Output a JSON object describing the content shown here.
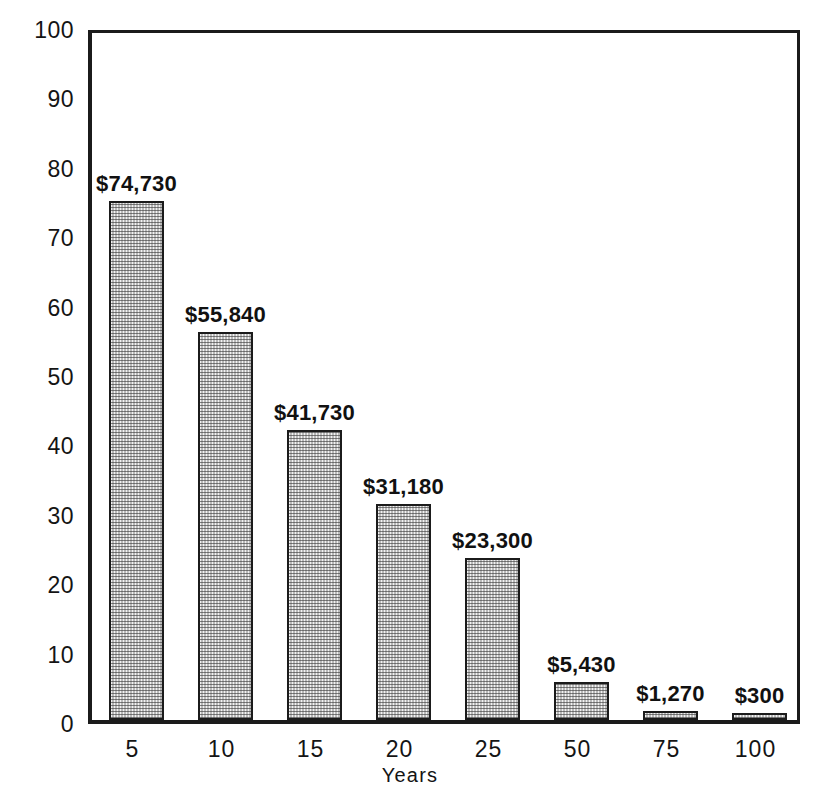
{
  "chart_data": {
    "type": "bar",
    "title": "",
    "xlabel": "Years",
    "ylabel": "Thousands of Dollars",
    "categories": [
      "5",
      "10",
      "15",
      "20",
      "25",
      "50",
      "75",
      "100"
    ],
    "values": [
      74.73,
      55.84,
      41.73,
      31.18,
      23.3,
      5.43,
      1.27,
      0.3
    ],
    "value_labels": [
      "$74,730",
      "$55,840",
      "$41,730",
      "$31,180",
      "$23,300",
      "$5,430",
      "$1,270",
      "$300"
    ],
    "ylim": [
      0,
      100
    ],
    "yticks": [
      0,
      10,
      20,
      30,
      40,
      50,
      60,
      70,
      80,
      90,
      100
    ],
    "ytick_labels": [
      "0",
      "10",
      "20",
      "30",
      "40",
      "50",
      "60",
      "70",
      "80",
      "90",
      "100"
    ],
    "grid": false,
    "legend": false,
    "units": "thousands of dollars",
    "colors": {
      "axis": "#1b1b1b",
      "bar_fill": "#f2f2f2",
      "bar_edge": "#1b1b1b",
      "text": "#141414",
      "background": "#ffffff"
    }
  },
  "axes": {
    "y_title": "Thousands of Dollars",
    "x_title": "Years"
  },
  "ticks": {
    "y": [
      "100",
      "90",
      "80",
      "70",
      "60",
      "50",
      "40",
      "30",
      "20",
      "10",
      "0"
    ],
    "x": [
      "5",
      "10",
      "15",
      "20",
      "25",
      "50",
      "75",
      "100"
    ]
  },
  "bars": [
    {
      "category": "5",
      "label": "$74,730",
      "value": 74.73
    },
    {
      "category": "10",
      "label": "$55,840",
      "value": 55.84
    },
    {
      "category": "15",
      "label": "$41,730",
      "value": 41.73
    },
    {
      "category": "20",
      "label": "$31,180",
      "value": 31.18
    },
    {
      "category": "25",
      "label": "$23,300",
      "value": 23.3
    },
    {
      "category": "50",
      "label": "$5,430",
      "value": 5.43
    },
    {
      "category": "75",
      "label": "$1,270",
      "value": 1.27
    },
    {
      "category": "100",
      "label": "$300",
      "value": 0.3
    }
  ]
}
